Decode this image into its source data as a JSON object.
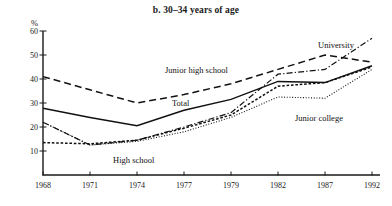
{
  "chart_data": {
    "type": "line",
    "title": "b. 30–34 years of age",
    "xlabel": "",
    "ylabel": "%",
    "ylim": [
      0,
      60
    ],
    "yticks": [
      10,
      20,
      30,
      40,
      50,
      60
    ],
    "grid": false,
    "legend_position": "inline-annotations",
    "categories": [
      "1968",
      "1971",
      "1974",
      "1977",
      "1979",
      "1982",
      "1987",
      "1992"
    ],
    "x": [
      1968,
      1971,
      1974,
      1977,
      1979,
      1982,
      1987,
      1992
    ],
    "series": [
      {
        "name": "Junior high school",
        "style": "long-dashed",
        "values": [
          41,
          35.5,
          30,
          33.5,
          38,
          44,
          50,
          47
        ]
      },
      {
        "name": "Total",
        "style": "solid",
        "values": [
          27.8,
          24,
          20.5,
          27,
          31.5,
          39,
          38.5,
          45.5
        ]
      },
      {
        "name": "University",
        "style": "dash-dot",
        "values": [
          22,
          12.5,
          14.5,
          20,
          26,
          42,
          44,
          57
        ]
      },
      {
        "name": "High school",
        "style": "short-dashed",
        "values": [
          13.5,
          13,
          14.5,
          19.5,
          25,
          37,
          38.5,
          45
        ]
      },
      {
        "name": "Junior college",
        "style": "dotted",
        "values": [
          22,
          12.5,
          14,
          18,
          24,
          32.5,
          32,
          44
        ]
      }
    ],
    "annotations": [
      {
        "text": "University",
        "series": "University",
        "x_px": 318,
        "y_px": 40
      },
      {
        "text": "Junior high school",
        "series": "Junior high school",
        "x_px": 165,
        "y_px": 65
      },
      {
        "text": "Total",
        "series": "Total",
        "x_px": 172,
        "y_px": 98
      },
      {
        "text": "Junior college",
        "series": "Junior college",
        "x_px": 295,
        "y_px": 113
      },
      {
        "text": "High school",
        "series": "High school",
        "x_px": 113,
        "y_px": 155
      }
    ]
  },
  "axes": {
    "y_unit": "%",
    "y_tick_labels": [
      "60",
      "50",
      "40",
      "30",
      "20",
      "10"
    ],
    "x_tick_labels": [
      "1968",
      "1971",
      "1974",
      "1977",
      "1979",
      "1982",
      "1987",
      "1992"
    ]
  }
}
